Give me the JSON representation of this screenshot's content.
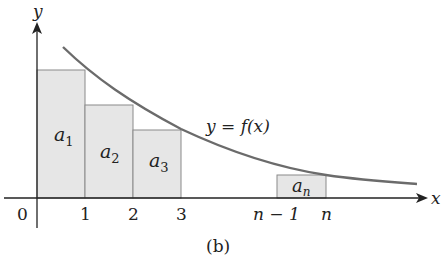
{
  "figure": {
    "caption": "(b)",
    "axes": {
      "x_label": "x",
      "y_label": "y",
      "origin_label": "0",
      "ticks": [
        "1",
        "2",
        "3",
        "n − 1",
        "n"
      ]
    },
    "curve": {
      "label": "y = f(x)",
      "color": "#6b6b6b"
    },
    "rectangles": [
      {
        "label_base": "a",
        "label_sub": "1",
        "x_from": "0",
        "x_to": "1"
      },
      {
        "label_base": "a",
        "label_sub": "2",
        "x_from": "1",
        "x_to": "2"
      },
      {
        "label_base": "a",
        "label_sub": "3",
        "x_from": "2",
        "x_to": "3"
      },
      {
        "label_base": "a",
        "label_sub": "n",
        "x_from": "n − 1",
        "x_to": "n"
      }
    ],
    "colors": {
      "rect_fill": "#e6e6e6",
      "rect_stroke": "#8a8a8a",
      "axis": "#222222"
    }
  }
}
